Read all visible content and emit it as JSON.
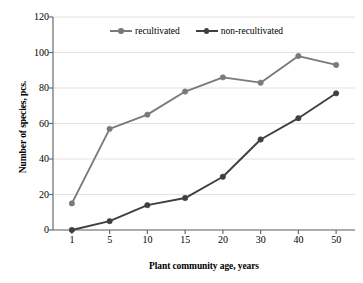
{
  "chart_data": {
    "type": "line",
    "title": "",
    "xlabel": "Plant community age, years",
    "ylabel": "Number of species, pcs.",
    "categories": [
      "1",
      "5",
      "10",
      "15",
      "20",
      "30",
      "40",
      "50"
    ],
    "series": [
      {
        "name": "recultivated",
        "color": "#7a7a7a",
        "values": [
          15,
          57,
          65,
          78,
          86,
          83,
          98,
          93
        ]
      },
      {
        "name": "non-recultivated",
        "color": "#3f3f3f",
        "values": [
          0,
          5,
          14,
          18,
          30,
          51,
          63,
          77
        ]
      }
    ],
    "ylim": [
      0,
      120
    ],
    "ytick_labels": [
      "0",
      "20",
      "40",
      "60",
      "80",
      "100",
      "120"
    ],
    "ytick_values": [
      0,
      20,
      40,
      60,
      80,
      100,
      120
    ],
    "grid": "horizontal",
    "grid_color": "#e2e2e2",
    "axis_color": "#6b6b6b",
    "legend_position": "top-center",
    "background": "#ffffff"
  }
}
